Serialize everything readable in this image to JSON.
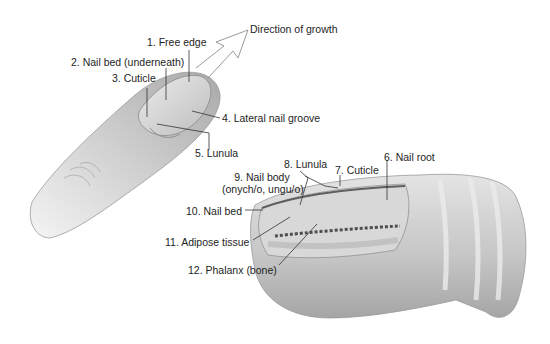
{
  "diagram": {
    "arrow_label": "Direction of growth",
    "finger_labels": [
      {
        "id": 1,
        "text": "1. Free edge"
      },
      {
        "id": 2,
        "text": "2. Nail bed (underneath)"
      },
      {
        "id": 3,
        "text": "3. Cuticle"
      },
      {
        "id": 4,
        "text": "4. Lateral nail groove"
      },
      {
        "id": 5,
        "text": "5. Lunula"
      }
    ],
    "section_labels": [
      {
        "id": 6,
        "text": "6. Nail root"
      },
      {
        "id": 7,
        "text": "7. Cuticle"
      },
      {
        "id": 8,
        "text": "8. Lunula"
      },
      {
        "id": 9,
        "text": "9. Nail body",
        "text2": "(onych/o, ungu/o)"
      },
      {
        "id": 10,
        "text": "10. Nail bed"
      },
      {
        "id": 11,
        "text": "11. Adipose tissue"
      },
      {
        "id": 12,
        "text": "12. Phalanx (bone)"
      }
    ]
  }
}
